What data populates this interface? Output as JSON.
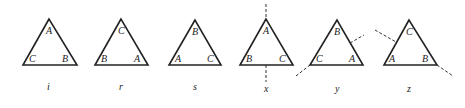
{
  "figures": [
    {
      "id": "i",
      "caption": "i",
      "top": "A",
      "left": "C",
      "right": "B",
      "axis": "none"
    },
    {
      "id": "r",
      "caption": "r",
      "top": "C",
      "left": "B",
      "right": "A",
      "axis": "none"
    },
    {
      "id": "s",
      "caption": "s",
      "top": "B",
      "left": "A",
      "right": "C",
      "axis": "none"
    },
    {
      "id": "x",
      "caption": "x",
      "top": "A",
      "left": "B",
      "right": "C",
      "axis": "vertical"
    },
    {
      "id": "y",
      "caption": "y",
      "top": "B",
      "left": "C",
      "right": "A",
      "axis": "through-left-vertex"
    },
    {
      "id": "z",
      "caption": "z",
      "top": "C",
      "left": "A",
      "right": "B",
      "axis": "through-right-vertex"
    }
  ]
}
